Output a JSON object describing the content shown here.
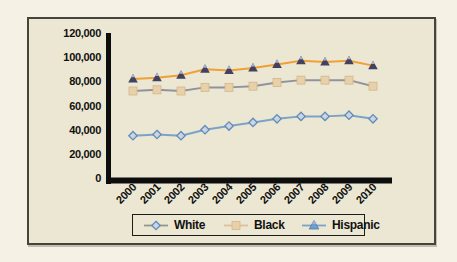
{
  "chart_data": {
    "type": "line",
    "title": "",
    "xlabel": "",
    "ylabel": "",
    "grid": false,
    "legend_position": "bottom",
    "x": [
      "2000",
      "2001",
      "2002",
      "2003",
      "2004",
      "2005",
      "2006",
      "2007",
      "2008",
      "2009",
      "2010"
    ],
    "ylim": [
      0,
      120000
    ],
    "ytick_values": [
      0,
      20000,
      40000,
      60000,
      80000,
      100000,
      120000
    ],
    "ytick_labels": [
      "0",
      "20,000",
      "40,000",
      "60,000",
      "80,000",
      "100,000",
      "120,000"
    ],
    "series": [
      {
        "name": "White",
        "marker": "diamond",
        "values": [
          35000,
          36000,
          35000,
          40000,
          43000,
          46000,
          49000,
          51000,
          51000,
          52000,
          49000
        ],
        "line_color": "#7ba3c8",
        "marker_fill": "#ccd4e4",
        "marker_stroke": "#5f8cb8",
        "legend_line_color": "#96958f"
      },
      {
        "name": "Black",
        "marker": "square",
        "values": [
          72000,
          73000,
          72000,
          75000,
          75000,
          76000,
          79000,
          81000,
          81000,
          81000,
          76000
        ],
        "line_color": "#92929f",
        "marker_fill": "#e9d0a9",
        "marker_stroke": "#d2b68d",
        "legend_line_color": "#ddc09a"
      },
      {
        "name": "Hispanic",
        "marker": "triangle",
        "values": [
          82000,
          83000,
          85000,
          90000,
          89000,
          91000,
          94000,
          97000,
          96000,
          97000,
          93000
        ],
        "line_color": "#efa036",
        "marker_fill": "#42425f",
        "marker_stroke": "#42425f",
        "marker_accent": "#a9b2d2",
        "legend_line_color": "#7ba3c8"
      }
    ],
    "axis_color": "#0d0d0d",
    "label_color": "#111111"
  }
}
